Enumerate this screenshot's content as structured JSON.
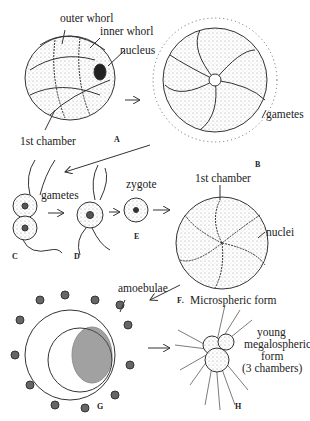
{
  "figure": {
    "stages": {
      "A": {
        "letter": "A",
        "labels": {
          "outer_whorl": "outer whorl",
          "inner_whorl": "inner whorl",
          "nucleus": "nucleus",
          "first_chamber": "1st chamber"
        }
      },
      "B": {
        "letter": "B",
        "labels": {
          "gametes": "gametes"
        }
      },
      "C": {
        "letter": "C",
        "labels": {
          "gametes": "gametes"
        }
      },
      "D": {
        "letter": "D"
      },
      "E": {
        "letter": "E",
        "labels": {
          "zygote": "zygote"
        }
      },
      "F": {
        "letter": "F.",
        "caption": "Microspheric form",
        "labels": {
          "first_chamber": "1st chamber",
          "nuclei": "nuclei"
        }
      },
      "G": {
        "letter": "G",
        "labels": {
          "amoebulae": "amoebulae"
        }
      },
      "H": {
        "letter": "H",
        "labels": {
          "line1": "young",
          "line2": "megalospheric",
          "line3": "form",
          "line4": "(3 chambers)"
        }
      }
    }
  }
}
